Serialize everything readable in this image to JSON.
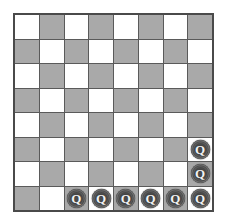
{
  "board": {
    "title": "Chessboard",
    "rows": 8,
    "columns": 8,
    "light_square_color": "#ffffff",
    "dark_square_color": "#a9a9a9",
    "gridline_color": "#5a5a5a",
    "border_color": "#4a4a4a",
    "piece_color": "#4a4a4a",
    "piece_glyph_color": "#f2f2f2",
    "piece_label": "Q",
    "piece_name": "queen",
    "queen_count": 8,
    "squares": [
      [
        {
          "shade": "light",
          "piece": null
        },
        {
          "shade": "dark",
          "piece": null
        },
        {
          "shade": "light",
          "piece": null
        },
        {
          "shade": "dark",
          "piece": null
        },
        {
          "shade": "light",
          "piece": null
        },
        {
          "shade": "dark",
          "piece": null
        },
        {
          "shade": "light",
          "piece": null
        },
        {
          "shade": "dark",
          "piece": null
        }
      ],
      [
        {
          "shade": "dark",
          "piece": null
        },
        {
          "shade": "light",
          "piece": null
        },
        {
          "shade": "dark",
          "piece": null
        },
        {
          "shade": "light",
          "piece": null
        },
        {
          "shade": "dark",
          "piece": null
        },
        {
          "shade": "light",
          "piece": null
        },
        {
          "shade": "dark",
          "piece": null
        },
        {
          "shade": "light",
          "piece": null
        }
      ],
      [
        {
          "shade": "light",
          "piece": null
        },
        {
          "shade": "dark",
          "piece": null
        },
        {
          "shade": "light",
          "piece": null
        },
        {
          "shade": "dark",
          "piece": null
        },
        {
          "shade": "light",
          "piece": null
        },
        {
          "shade": "dark",
          "piece": null
        },
        {
          "shade": "light",
          "piece": null
        },
        {
          "shade": "dark",
          "piece": null
        }
      ],
      [
        {
          "shade": "dark",
          "piece": null
        },
        {
          "shade": "light",
          "piece": null
        },
        {
          "shade": "dark",
          "piece": null
        },
        {
          "shade": "light",
          "piece": null
        },
        {
          "shade": "dark",
          "piece": null
        },
        {
          "shade": "light",
          "piece": null
        },
        {
          "shade": "dark",
          "piece": null
        },
        {
          "shade": "light",
          "piece": null
        }
      ],
      [
        {
          "shade": "light",
          "piece": null
        },
        {
          "shade": "dark",
          "piece": null
        },
        {
          "shade": "light",
          "piece": null
        },
        {
          "shade": "dark",
          "piece": null
        },
        {
          "shade": "light",
          "piece": null
        },
        {
          "shade": "dark",
          "piece": null
        },
        {
          "shade": "light",
          "piece": null
        },
        {
          "shade": "dark",
          "piece": null
        }
      ],
      [
        {
          "shade": "dark",
          "piece": null
        },
        {
          "shade": "light",
          "piece": null
        },
        {
          "shade": "dark",
          "piece": null
        },
        {
          "shade": "light",
          "piece": null
        },
        {
          "shade": "dark",
          "piece": null
        },
        {
          "shade": "light",
          "piece": null
        },
        {
          "shade": "dark",
          "piece": null
        },
        {
          "shade": "light",
          "piece": "Q"
        }
      ],
      [
        {
          "shade": "light",
          "piece": null
        },
        {
          "shade": "dark",
          "piece": null
        },
        {
          "shade": "light",
          "piece": null
        },
        {
          "shade": "dark",
          "piece": null
        },
        {
          "shade": "light",
          "piece": null
        },
        {
          "shade": "dark",
          "piece": null
        },
        {
          "shade": "light",
          "piece": null
        },
        {
          "shade": "dark",
          "piece": "Q"
        }
      ],
      [
        {
          "shade": "dark",
          "piece": null
        },
        {
          "shade": "light",
          "piece": null
        },
        {
          "shade": "dark",
          "piece": "Q"
        },
        {
          "shade": "light",
          "piece": "Q"
        },
        {
          "shade": "dark",
          "piece": "Q"
        },
        {
          "shade": "light",
          "piece": "Q"
        },
        {
          "shade": "dark",
          "piece": "Q"
        },
        {
          "shade": "light",
          "piece": "Q"
        }
      ]
    ]
  }
}
